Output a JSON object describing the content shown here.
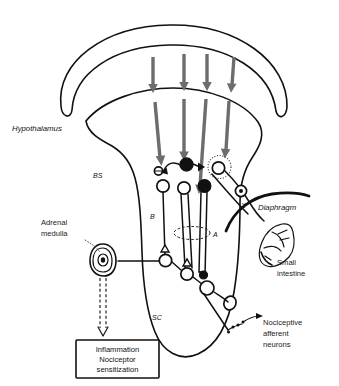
{
  "figure": {
    "title_labels": {
      "hypothalamus": "Hypothalamus",
      "brainstem": "BS",
      "spinal_cord": "SC",
      "pathway_b": "B",
      "pathway_a": "A",
      "vagus": "X",
      "diaphragm": "Diaphragm",
      "small_intestine_line1": "Small",
      "small_intestine_line2": "intestine",
      "adrenal_line1": "Adrenal",
      "adrenal_line2": "medulla",
      "nociceptive_line1": "Nociceptive",
      "nociceptive_line2": "afferent",
      "nociceptive_line3": "neurons"
    },
    "callout_box": {
      "line1": "Inflammation",
      "line2": "Nociceptor",
      "line3": "sensitization"
    },
    "colors": {
      "descending_arrow": "#6d6d6d",
      "outline": "#111111",
      "background": "#ffffff",
      "soma_filled": "#111111",
      "soma_open": "#ffffff"
    },
    "elements": {
      "descending_arrow_count": 4,
      "inhibitory_symbol": "⊖",
      "cortex_band": "cerebral-cortex-band",
      "brain_outline": "brain-and-brainstem-outline"
    }
  }
}
